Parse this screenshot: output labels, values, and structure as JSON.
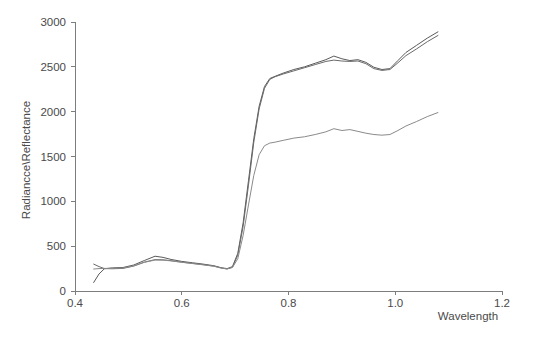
{
  "chart_data": {
    "type": "line",
    "title": "",
    "subtitle": "",
    "xlabel": "Wavelength",
    "ylabel": "Radiancce\\Reflectance",
    "xlim": [
      0.4,
      1.2
    ],
    "ylim": [
      0,
      3000
    ],
    "xticks": [
      "0.4",
      "0.6",
      "0.8",
      "1.0",
      "1.2"
    ],
    "xtick_values": [
      0.4,
      0.6,
      0.8,
      1.0,
      1.2
    ],
    "yticks": [
      "0",
      "500",
      "1000",
      "1500",
      "2000",
      "2500",
      "3000"
    ],
    "ytick_values": [
      0,
      500,
      1000,
      1500,
      2000,
      2500,
      3000
    ],
    "grid": false,
    "legend": "none",
    "series": [
      {
        "name": "spectrum-1",
        "color": "#5a5a5a",
        "x": [
          0.435,
          0.445,
          0.455,
          0.47,
          0.49,
          0.51,
          0.53,
          0.55,
          0.565,
          0.58,
          0.6,
          0.62,
          0.64,
          0.66,
          0.675,
          0.685,
          0.695,
          0.705,
          0.715,
          0.725,
          0.735,
          0.745,
          0.755,
          0.765,
          0.775,
          0.79,
          0.81,
          0.83,
          0.85,
          0.87,
          0.885,
          0.9,
          0.915,
          0.93,
          0.945,
          0.96,
          0.975,
          0.99,
          1.005,
          1.02,
          1.04,
          1.06,
          1.08
        ],
        "y": [
          95,
          190,
          248,
          258,
          262,
          290,
          340,
          388,
          375,
          352,
          330,
          315,
          300,
          282,
          258,
          250,
          272,
          420,
          760,
          1230,
          1700,
          2060,
          2280,
          2370,
          2395,
          2430,
          2470,
          2500,
          2540,
          2580,
          2620,
          2590,
          2570,
          2580,
          2550,
          2495,
          2470,
          2480,
          2570,
          2660,
          2740,
          2820,
          2890
        ]
      },
      {
        "name": "spectrum-2",
        "color": "#6a6a6a",
        "x": [
          0.435,
          0.445,
          0.455,
          0.47,
          0.49,
          0.51,
          0.53,
          0.55,
          0.565,
          0.58,
          0.6,
          0.62,
          0.64,
          0.66,
          0.675,
          0.685,
          0.695,
          0.705,
          0.715,
          0.725,
          0.735,
          0.745,
          0.755,
          0.765,
          0.775,
          0.79,
          0.81,
          0.83,
          0.85,
          0.87,
          0.885,
          0.9,
          0.915,
          0.93,
          0.945,
          0.96,
          0.975,
          0.99,
          1.005,
          1.02,
          1.04,
          1.06,
          1.08
        ],
        "y": [
          300,
          272,
          250,
          248,
          252,
          278,
          322,
          350,
          348,
          338,
          322,
          308,
          294,
          278,
          256,
          246,
          265,
          400,
          720,
          1180,
          1660,
          2030,
          2260,
          2360,
          2390,
          2420,
          2455,
          2490,
          2525,
          2560,
          2575,
          2565,
          2560,
          2565,
          2535,
          2480,
          2460,
          2470,
          2545,
          2625,
          2700,
          2780,
          2850
        ]
      },
      {
        "name": "spectrum-3",
        "color": "#8a8a8a",
        "x": [
          0.435,
          0.445,
          0.455,
          0.47,
          0.49,
          0.51,
          0.53,
          0.55,
          0.565,
          0.58,
          0.6,
          0.62,
          0.64,
          0.66,
          0.675,
          0.685,
          0.695,
          0.705,
          0.715,
          0.725,
          0.735,
          0.745,
          0.755,
          0.765,
          0.775,
          0.79,
          0.81,
          0.83,
          0.85,
          0.87,
          0.885,
          0.9,
          0.915,
          0.93,
          0.945,
          0.96,
          0.975,
          0.99,
          1.005,
          1.02,
          1.04,
          1.06,
          1.08
        ],
        "y": [
          245,
          250,
          252,
          252,
          256,
          280,
          320,
          345,
          344,
          336,
          320,
          306,
          292,
          276,
          254,
          246,
          262,
          360,
          620,
          960,
          1290,
          1520,
          1620,
          1650,
          1660,
          1680,
          1705,
          1720,
          1745,
          1775,
          1810,
          1790,
          1800,
          1780,
          1760,
          1745,
          1738,
          1745,
          1790,
          1840,
          1890,
          1945,
          1990
        ]
      }
    ]
  },
  "axes": {
    "x_axis_label": "Wavelength",
    "y_axis_label": "Radiancce\\Reflectance"
  }
}
